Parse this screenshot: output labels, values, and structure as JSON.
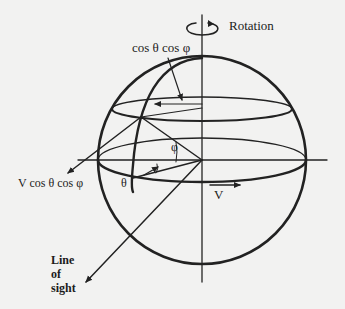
{
  "diagram": {
    "labels": {
      "rotation": "Rotation",
      "cos_theta_cos_phi": "cos θ cos φ",
      "v_cos_theta_cos_phi": "V cos θ cos φ",
      "theta": "θ",
      "phi": "φ",
      "velocity": "V",
      "line_of_sight": "Line\nof\nsight"
    },
    "geometry": {
      "sphere_center": [
        202,
        160
      ],
      "sphere_radius": 104,
      "stroke_color": "#222222",
      "background_color": "#f2f2f1"
    }
  }
}
